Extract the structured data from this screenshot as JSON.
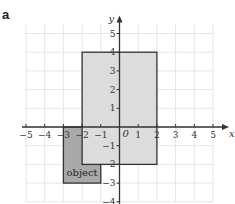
{
  "panel_label": "a",
  "chart_data": {
    "type": "diagram",
    "title": "",
    "xlabel": "x",
    "ylabel": "y",
    "xlim": [
      -5,
      5
    ],
    "ylim": [
      -4,
      5
    ],
    "origin_label": "0",
    "x_ticks": [
      -5,
      -4,
      -3,
      -2,
      -1,
      1,
      2,
      3,
      4,
      5
    ],
    "y_ticks": [
      5,
      4,
      3,
      2,
      1,
      -1,
      -2,
      -3,
      -4
    ],
    "grid": true,
    "shapes": [
      {
        "name": "object",
        "label": "object",
        "type": "rectangle",
        "x0": -3,
        "x1": -1,
        "y0": -3,
        "y1": 0,
        "fill": "#a9a9a9",
        "stroke": "#333333"
      },
      {
        "name": "image",
        "label": "",
        "type": "rectangle",
        "x0": -2,
        "x1": 2,
        "y0": -2,
        "y1": 4,
        "fill": "#dcdcdc",
        "stroke": "#333333"
      }
    ]
  },
  "colors": {
    "grid": "#e6e6e6",
    "axis": "#333333",
    "object_fill": "#a9a9a9",
    "image_fill": "#dcdcdc"
  }
}
